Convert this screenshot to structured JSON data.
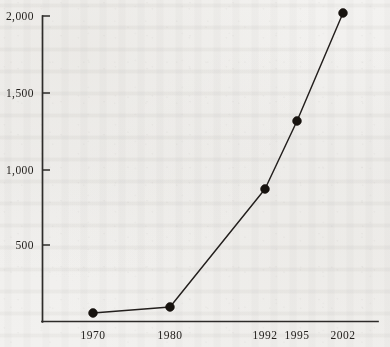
{
  "chart_data": {
    "type": "line",
    "title": "",
    "subtitle": "",
    "xlabel": "",
    "ylabel": "",
    "categories": [
      "1970",
      "1980",
      "1992",
      "1995",
      "2002"
    ],
    "x": [
      1970,
      1980,
      1992,
      1995,
      2002
    ],
    "values": [
      60,
      150,
      875,
      1320,
      2010
    ],
    "series": [
      {
        "name": "",
        "values": [
          60,
          150,
          875,
          1320,
          2010
        ]
      }
    ],
    "points": [
      {
        "x_label": "1970",
        "x": 1970,
        "y": 60,
        "px": 93,
        "py": 313
      },
      {
        "x_label": "1980",
        "x": 1980,
        "y": 150,
        "px": 170,
        "py": 307
      },
      {
        "x_label": "1992",
        "x": 1992,
        "y": 875,
        "px": 265,
        "py": 189
      },
      {
        "x_label": "1995",
        "x": 1995,
        "y": 1320,
        "px": 297,
        "py": 121
      },
      {
        "x_label": "2002",
        "x": 2002,
        "y": 2010,
        "px": 343,
        "py": 13
      }
    ],
    "ylim": [
      0,
      2000
    ],
    "yticks": [
      500,
      1000,
      1500,
      2000
    ],
    "ytick_labels": [
      "500",
      "1,000",
      "1,500",
      "2,000"
    ],
    "xtick_labels": [
      "1970",
      "1980",
      "1992",
      "1995",
      "2002"
    ],
    "grid": false,
    "legend": false,
    "legend_position": "none",
    "marker": "filled-circle",
    "line_color": "#231f1d",
    "marker_color": "#17130f",
    "axis_color": "#2d2b29",
    "background_color": "#f1f0ee"
  },
  "axes": {
    "y_ticks": [
      {
        "label": "2,000",
        "value": 2000,
        "py": 16
      },
      {
        "label": "1,500",
        "value": 1500,
        "py": 93
      },
      {
        "label": "1,000",
        "value": 1000,
        "py": 170
      },
      {
        "label": "500",
        "value": 500,
        "py": 245
      }
    ],
    "x_ticks": [
      {
        "label": "1970",
        "px": 93
      },
      {
        "label": "1980",
        "px": 170
      },
      {
        "label": "1992",
        "px": 265
      },
      {
        "label": "1995",
        "px": 297
      },
      {
        "label": "2002",
        "px": 343
      }
    ]
  }
}
